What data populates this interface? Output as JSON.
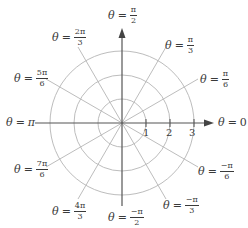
{
  "diagram": {
    "center": {
      "x": 122,
      "y": 123
    },
    "radius_unit_px": 24,
    "circles": [
      1,
      2,
      3
    ],
    "radial_tick_labels": [
      "1",
      "2",
      "3"
    ],
    "colors": {
      "axis": "#555555",
      "grid": "#bdbdbd",
      "text": "#3a3a3a"
    },
    "angle_labels": [
      {
        "name": "theta-0",
        "theta": "θ",
        "eq": "=",
        "value": "0",
        "frac": false
      },
      {
        "name": "theta-pi-6",
        "theta": "θ",
        "eq": "=",
        "num": "π",
        "den": "6",
        "frac": true
      },
      {
        "name": "theta-pi-3",
        "theta": "θ",
        "eq": "=",
        "num": "π",
        "den": "3",
        "frac": true
      },
      {
        "name": "theta-pi-2",
        "theta": "θ",
        "eq": "=",
        "num": "π",
        "den": "2",
        "frac": true
      },
      {
        "name": "theta-2pi-3",
        "theta": "θ",
        "eq": "=",
        "num": "2π",
        "den": "3",
        "frac": true
      },
      {
        "name": "theta-5pi-6",
        "theta": "θ",
        "eq": "=",
        "num": "5π",
        "den": "6",
        "frac": true
      },
      {
        "name": "theta-pi",
        "theta": "θ",
        "eq": "=",
        "value": "π",
        "frac": false
      },
      {
        "name": "theta-7pi-6",
        "theta": "θ",
        "eq": "=",
        "num": "7π",
        "den": "6",
        "frac": true
      },
      {
        "name": "theta-4pi-3",
        "theta": "θ",
        "eq": "=",
        "num": "4π",
        "den": "3",
        "frac": true
      },
      {
        "name": "theta-neg-pi-2",
        "theta": "θ",
        "eq": "=",
        "num": "−π",
        "den": "2",
        "frac": true
      },
      {
        "name": "theta-neg-pi-3",
        "theta": "θ",
        "eq": "=",
        "num": "−π",
        "den": "3",
        "frac": true
      },
      {
        "name": "theta-neg-pi-6",
        "theta": "θ",
        "eq": "=",
        "num": "−π",
        "den": "6",
        "frac": true
      }
    ]
  }
}
